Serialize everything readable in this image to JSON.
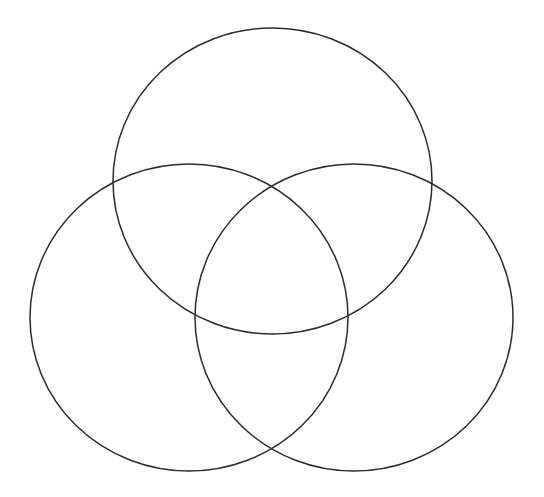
{
  "diagram": {
    "type": "venn",
    "set_count": 3,
    "background": "#ffffff",
    "stroke_color": "#2b2b2b",
    "stroke_width": 1.5,
    "sets": [
      {
        "id": "top",
        "label": "",
        "cx": 272.5,
        "cy": 181,
        "rx": 159.5,
        "ry": 153
      },
      {
        "id": "left",
        "label": "",
        "cx": 189,
        "cy": 317.5,
        "rx": 159,
        "ry": 153.5
      },
      {
        "id": "right",
        "label": "",
        "cx": 354,
        "cy": 317.5,
        "rx": 159,
        "ry": 153.5
      }
    ]
  }
}
